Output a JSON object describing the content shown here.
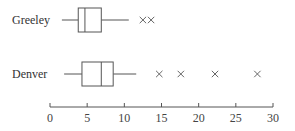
{
  "chart_data": {
    "type": "boxplot",
    "orientation": "horizontal",
    "title": "",
    "xlabel": "",
    "ylabel": "",
    "xlim": [
      0,
      30
    ],
    "xticks": [
      0,
      5,
      10,
      15,
      20,
      25,
      30
    ],
    "grid": false,
    "series": [
      {
        "name": "Greeley",
        "min": 1.6,
        "q1": 3.8,
        "median": 4.7,
        "q3": 6.9,
        "max": 10.6,
        "outliers": [
          12.5,
          13.6
        ]
      },
      {
        "name": "Denver",
        "min": 1.9,
        "q1": 4.3,
        "median": 6.9,
        "q3": 8.5,
        "max": 11.6,
        "outliers": [
          14.7,
          17.6,
          22.2,
          27.9
        ]
      }
    ],
    "outlier_marker": "x"
  },
  "labels": {
    "greeley": "Greeley",
    "denver": "Denver"
  },
  "axis": {
    "ticks": [
      "0",
      "5",
      "10",
      "15",
      "20",
      "25",
      "30"
    ]
  }
}
